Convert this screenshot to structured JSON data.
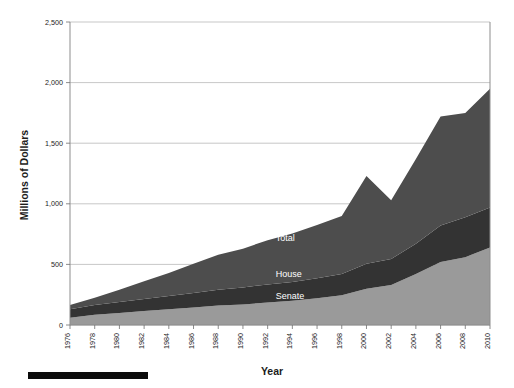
{
  "chart_data": {
    "type": "area",
    "stacked": true,
    "title": "",
    "subtitle": "",
    "xlabel": "Year",
    "ylabel": "Millions of Dollars",
    "xlim": [
      1976,
      2010
    ],
    "ylim": [
      0,
      2500
    ],
    "ytick_labels": [
      "0",
      "500",
      "1,000",
      "1,500",
      "2,000",
      "2,500"
    ],
    "ytick_values": [
      0,
      500,
      1000,
      1500,
      2000,
      2500
    ],
    "xtick_labels": [
      "1976",
      "1978",
      "1980",
      "1982",
      "1984",
      "1986",
      "1988",
      "1990",
      "1992",
      "1994",
      "1996",
      "1998",
      "2000",
      "2002",
      "2004",
      "2006",
      "2008",
      "2010"
    ],
    "x": [
      1976,
      1978,
      1980,
      1982,
      1984,
      1986,
      1988,
      1990,
      1992,
      1994,
      1996,
      1998,
      2000,
      2002,
      2004,
      2006,
      2008,
      2010
    ],
    "grid": true,
    "legend_position": "inline-annotations",
    "series": [
      {
        "name": "Senate",
        "color": "#9a9a9a",
        "label_text": "Senate",
        "values": [
          60,
          85,
          100,
          115,
          130,
          145,
          160,
          170,
          185,
          200,
          220,
          245,
          300,
          330,
          420,
          520,
          560,
          640
        ]
      },
      {
        "name": "House",
        "color": "#333333",
        "label_text": "House",
        "values": [
          70,
          80,
          90,
          100,
          110,
          120,
          130,
          140,
          150,
          155,
          165,
          175,
          205,
          215,
          250,
          300,
          330,
          330
        ]
      },
      {
        "name": "Total",
        "color": "#4d4d4d",
        "label_text": "Total",
        "values": [
          35,
          60,
          100,
          145,
          190,
          240,
          290,
          320,
          365,
          400,
          440,
          480,
          725,
          485,
          700,
          900,
          860,
          980
        ]
      }
    ],
    "cumulative_totals": [
      165,
      225,
      290,
      360,
      430,
      505,
      580,
      630,
      700,
      755,
      825,
      900,
      1230,
      1030,
      1370,
      1720,
      1750,
      1950
    ],
    "annotations": [
      {
        "text": "Total",
        "x": 1992,
        "y": 690
      },
      {
        "text": "House",
        "x": 1992,
        "y": 400
      },
      {
        "text": "Senate",
        "x": 1992,
        "y": 215
      }
    ]
  },
  "footer": {
    "bar_present": true,
    "bar_color": "#0b0b0b"
  },
  "colors": {
    "senate": "#9a9a9a",
    "house": "#333333",
    "total": "#4d4d4d",
    "grid": "#b9b9b9",
    "axis": "#8d8d8d",
    "text": "#1c1c1c"
  }
}
